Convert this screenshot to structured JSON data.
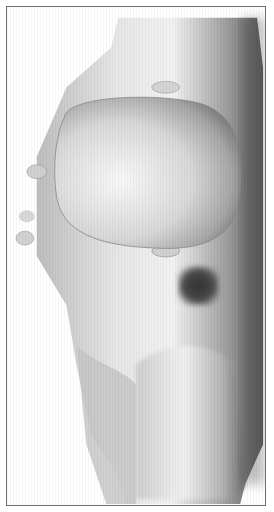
{
  "figure": {
    "type": "3d-grayscale-render",
    "frame_color": "#6e6e6e",
    "background": "#ffffff",
    "marker": {
      "color": "#3a3a3a",
      "shape": "soft-square"
    }
  }
}
